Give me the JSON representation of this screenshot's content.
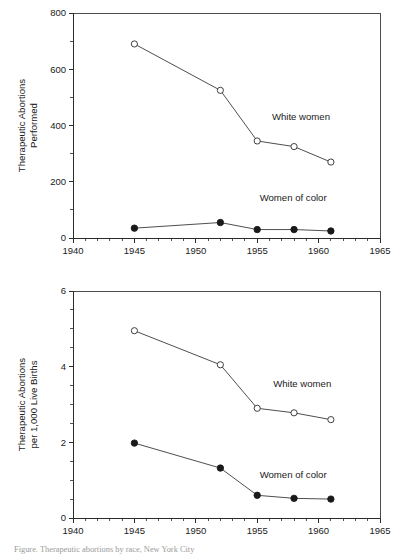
{
  "figure": {
    "caption": "Figure. Therapeutic abortions by race, New York City"
  },
  "charts": [
    {
      "id": "top",
      "ylabel_line1": "Therapeutic Abortions",
      "ylabel_line2": "Performed",
      "y_ticks": [
        "0",
        "200",
        "400",
        "600",
        "800"
      ],
      "x_ticks": [
        "1940",
        "1945",
        "1950",
        "1955",
        "1960",
        "1965"
      ],
      "label_white": "White women",
      "label_color": "Women of color"
    },
    {
      "id": "bottom",
      "ylabel_line1": "Therapeutic Abortions",
      "ylabel_line2": "per 1,000 Live Births",
      "y_ticks": [
        "0",
        "2",
        "4",
        "6"
      ],
      "x_ticks": [
        "1940",
        "1945",
        "1950",
        "1955",
        "1960",
        "1965"
      ],
      "label_white": "White women",
      "label_color": "Women of color"
    }
  ],
  "chart_data": [
    {
      "type": "line",
      "title": "Therapeutic Abortions Performed",
      "xlabel": "",
      "ylabel": "Therapeutic Abortions Performed",
      "xlim": [
        1940,
        1965
      ],
      "ylim": [
        0,
        800
      ],
      "y_major_ticks": [
        0,
        200,
        400,
        600,
        800
      ],
      "y_minor_step": 100,
      "x_major_ticks": [
        1940,
        1945,
        1950,
        1955,
        1960,
        1965
      ],
      "x_minor_step": 1,
      "grid": false,
      "legend": "inline-annotations",
      "x": [
        1945,
        1952,
        1955,
        1958,
        1961
      ],
      "series": [
        {
          "name": "White women",
          "marker": "open-circle",
          "values": [
            690,
            525,
            345,
            325,
            270
          ]
        },
        {
          "name": "Women of color",
          "marker": "filled-circle",
          "values": [
            35,
            55,
            30,
            30,
            25
          ]
        }
      ],
      "annotations": [
        {
          "text": "White women",
          "x": 1956.2,
          "y": 420
        },
        {
          "text": "Women of color",
          "x": 1955.2,
          "y": 130
        }
      ]
    },
    {
      "type": "line",
      "title": "Therapeutic Abortions per 1,000 Live Births",
      "xlabel": "",
      "ylabel": "Therapeutic Abortions per 1,000 Live Births",
      "xlim": [
        1940,
        1965
      ],
      "ylim": [
        0,
        6
      ],
      "y_major_ticks": [
        0,
        2,
        4,
        6
      ],
      "y_minor_step": 0.5,
      "x_major_ticks": [
        1940,
        1945,
        1950,
        1955,
        1960,
        1965
      ],
      "x_minor_step": 1,
      "grid": false,
      "legend": "inline-annotations",
      "x": [
        1945,
        1952,
        1955,
        1958,
        1961
      ],
      "series": [
        {
          "name": "White women",
          "marker": "open-circle",
          "values": [
            4.95,
            4.05,
            2.9,
            2.78,
            2.6
          ]
        },
        {
          "name": "Women of color",
          "marker": "filled-circle",
          "values": [
            1.98,
            1.32,
            0.6,
            0.52,
            0.5
          ]
        }
      ],
      "annotations": [
        {
          "text": "White women",
          "x": 1956.3,
          "y": 3.45
        },
        {
          "text": "Women of color",
          "x": 1955.2,
          "y": 1.05
        }
      ]
    }
  ]
}
